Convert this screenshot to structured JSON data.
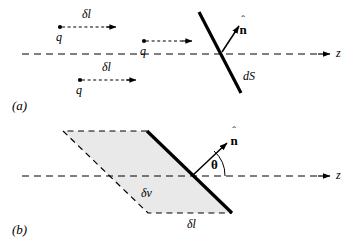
{
  "figure": {
    "background_color": "#ffffff",
    "stroke_color": "#000000",
    "shaded_fill": "#e8e8e8",
    "width": 358,
    "height": 247
  },
  "panel_a": {
    "label": "(a)",
    "axis_label": "z",
    "surface_label": "dS",
    "normal_label": {
      "hat": "ˆ",
      "symbol": "n"
    },
    "charges": [
      {
        "charge_label": "q",
        "displacement_label": "δl"
      },
      {
        "charge_label": "q",
        "displacement_label": ""
      },
      {
        "charge_label": "q",
        "displacement_label": "δl"
      }
    ]
  },
  "panel_b": {
    "label": "(b)",
    "axis_label": "z",
    "volume_label": "δv",
    "length_label": "δl",
    "angle_label": "θ",
    "normal_label": {
      "hat": "ˆ",
      "symbol": "n"
    }
  }
}
